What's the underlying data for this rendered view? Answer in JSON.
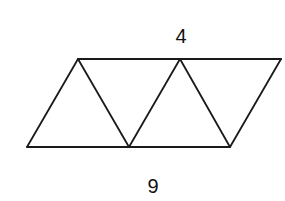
{
  "diagram": {
    "type": "geometry",
    "labels": {
      "top": "4",
      "bottom": "9"
    },
    "stroke_color": "#1a1a1a",
    "background": "#ffffff",
    "vertices": {
      "top_left": [
        78,
        59
      ],
      "top_middle": [
        180,
        59
      ],
      "top_right": [
        281,
        59
      ],
      "bottom_left": [
        27,
        147
      ],
      "bottom_middle": [
        129,
        147
      ],
      "bottom_right": [
        230,
        147
      ]
    },
    "segments": [
      {
        "name": "top-edge",
        "from": "top_left",
        "to": "top_right"
      },
      {
        "name": "bottom-edge",
        "from": "bottom_left",
        "to": "bottom_right"
      },
      {
        "name": "left-edge",
        "from": "bottom_left",
        "to": "top_left"
      },
      {
        "name": "right-edge",
        "from": "bottom_right",
        "to": "top_right"
      },
      {
        "name": "diagonal-1",
        "from": "top_left",
        "to": "bottom_middle"
      },
      {
        "name": "diagonal-2",
        "from": "bottom_middle",
        "to": "top_middle"
      },
      {
        "name": "diagonal-3",
        "from": "top_middle",
        "to": "bottom_right"
      }
    ]
  }
}
